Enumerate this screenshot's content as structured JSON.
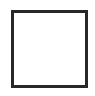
{
  "canvas": {
    "width": 95,
    "height": 96,
    "background_color": "#ffffff"
  },
  "shape": {
    "kind": "square-outline",
    "label": "",
    "x": 11,
    "y": 10,
    "width": 77,
    "height": 78,
    "border_width": 3,
    "border_color": "#282828",
    "fill_color": "#ffffff"
  },
  "content": {
    "inner_text": ""
  }
}
